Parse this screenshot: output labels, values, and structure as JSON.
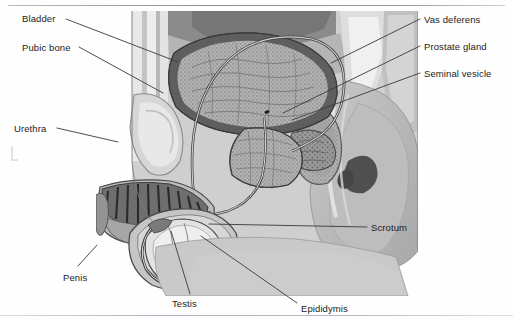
{
  "figure": {
    "title_cropped": "",
    "illustration_name": "male-reproductive-system-sagittal-section",
    "style": "grayscale medical illustration",
    "colors": {
      "background": "#fefefe",
      "label_text": "#1c1c1c",
      "leader_line": "#3a3a3a",
      "rule_top": "#8e8e8e",
      "rule_bottom": "#aab3c0",
      "tissue_light": "#e2e2e2",
      "tissue_mid": "#c3c3c3",
      "tissue_dark": "#8d8d8d",
      "tissue_darkest": "#4a4a4a",
      "outline": "#555555"
    }
  },
  "labels": {
    "left": [
      {
        "id": "bladder",
        "text": "Bladder",
        "x": 22,
        "y": 13
      },
      {
        "id": "pubic-bone",
        "text": "Pubic bone",
        "x": 22,
        "y": 42
      },
      {
        "id": "urethra",
        "text": "Urethra",
        "x": 14,
        "y": 123
      },
      {
        "id": "penis",
        "text": "Penis",
        "x": 63,
        "y": 272
      }
    ],
    "right": [
      {
        "id": "vas-deferens",
        "text": "Vas deferens",
        "x": 424,
        "y": 14
      },
      {
        "id": "prostate-gland",
        "text": "Prostate gland",
        "x": 424,
        "y": 41
      },
      {
        "id": "seminal-vesicle",
        "text": "Seminal vesicle",
        "x": 424,
        "y": 68
      },
      {
        "id": "scrotum",
        "text": "Scrotum",
        "x": 371,
        "y": 222
      }
    ],
    "bottom": [
      {
        "id": "testis",
        "text": "Testis",
        "x": 172,
        "y": 298
      },
      {
        "id": "epididymis",
        "text": "Epididymis",
        "x": 301,
        "y": 303
      }
    ]
  },
  "leader_lines": [
    {
      "id": "bladder-leader",
      "points": "66,19 178,62"
    },
    {
      "id": "pubic-bone-leader",
      "points": "79,47 163,93"
    },
    {
      "id": "urethra-leader",
      "points": "57,128 118,142"
    },
    {
      "id": "penis-leader",
      "points": "78,266 97,245"
    },
    {
      "id": "vas-deferens-leader",
      "points": "420,19 331,63"
    },
    {
      "id": "prostate-gland-leader",
      "points": "420,46 283,113"
    },
    {
      "id": "seminal-vesicle-leader",
      "points": "420,73 292,120"
    },
    {
      "id": "scrotum-leader",
      "points": "367,227 209,224"
    },
    {
      "id": "testis-leader",
      "points": "190,294 171,231"
    },
    {
      "id": "epididymis-leader",
      "points": "297,303 201,236"
    }
  ],
  "structures": [
    "bladder",
    "pubic bone",
    "urethra",
    "penis",
    "vas deferens",
    "prostate gland",
    "seminal vesicle",
    "scrotum",
    "testis",
    "epididymis",
    "rectum",
    "sacrum"
  ]
}
